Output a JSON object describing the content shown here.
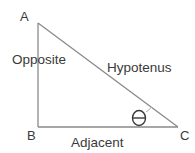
{
  "diagram": {
    "type": "right-triangle",
    "vertices": {
      "A": {
        "label": "A"
      },
      "B": {
        "label": "B"
      },
      "C": {
        "label": "C"
      }
    },
    "sides": {
      "opposite": {
        "label": "Opposite"
      },
      "hypotenuse": {
        "label": "Hypotenus"
      },
      "adjacent": {
        "label": "Adjacent"
      }
    },
    "angle": {
      "symbol": "theta",
      "at_vertex": "C"
    },
    "colors": {
      "line": "#8a8a8a",
      "text": "#3a3a3a",
      "background": "#ffffff"
    }
  }
}
